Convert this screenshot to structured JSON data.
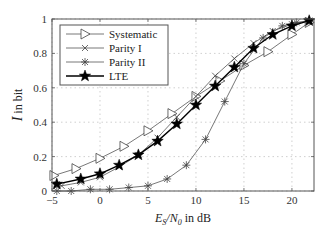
{
  "chart_data": {
    "type": "line",
    "title": "",
    "xlabel": "E_S/N_0 in dB",
    "ylabel": "I in bit",
    "xlim": [
      -5,
      22.3
    ],
    "ylim": [
      0,
      1
    ],
    "xticks": [
      -5,
      0,
      5,
      10,
      15,
      20
    ],
    "yticks": [
      0,
      0.2,
      0.4,
      0.6,
      0.8,
      1
    ],
    "xtick_labels": [
      "−5",
      "0",
      "5",
      "10",
      "15",
      "20"
    ],
    "ytick_labels": [
      "0",
      "0.2",
      "0.4",
      "0.6",
      "0.8",
      "1"
    ],
    "grid": true,
    "legend_position": "upper left",
    "series": [
      {
        "name": "Systematic",
        "marker": "triangle-right",
        "x": [
          -4.8,
          -2.5,
          0,
          2.5,
          5,
          7.5,
          10,
          12.5,
          15,
          17.5,
          20,
          21.8
        ],
        "y": [
          0.09,
          0.13,
          0.19,
          0.26,
          0.35,
          0.45,
          0.55,
          0.64,
          0.73,
          0.81,
          0.91,
          0.98
        ]
      },
      {
        "name": "Parity I",
        "marker": "x",
        "x": [
          -4.5,
          -4,
          -2,
          0,
          2,
          4,
          6,
          8,
          10,
          12,
          14,
          16,
          18,
          20,
          21.8
        ],
        "y": [
          0.04,
          0.03,
          0.05,
          0.08,
          0.14,
          0.21,
          0.31,
          0.43,
          0.55,
          0.67,
          0.77,
          0.86,
          0.93,
          0.97,
          0.99
        ]
      },
      {
        "name": "Parity II",
        "marker": "asterisk",
        "x": [
          -4.5,
          -3,
          -1,
          1,
          3,
          5,
          7,
          9,
          11,
          13,
          15,
          17,
          19,
          20.5,
          21.8
        ],
        "y": [
          0.0,
          0.0,
          0.01,
          0.01,
          0.02,
          0.03,
          0.07,
          0.15,
          0.3,
          0.52,
          0.74,
          0.89,
          0.96,
          0.98,
          0.99
        ]
      },
      {
        "name": "LTE",
        "marker": "star",
        "x": [
          -4.5,
          -2,
          0,
          2,
          4,
          6,
          8,
          10,
          12,
          14,
          16,
          18,
          20,
          21.8
        ],
        "y": [
          0.04,
          0.07,
          0.1,
          0.15,
          0.21,
          0.29,
          0.39,
          0.5,
          0.61,
          0.72,
          0.83,
          0.91,
          0.96,
          0.99
        ]
      }
    ]
  },
  "legend": {
    "items": [
      "Systematic",
      "Parity I",
      "Parity II",
      "LTE"
    ]
  },
  "axes": {
    "xlabel_main": "E",
    "xlabel_sub1": "S",
    "xlabel_slash": "/N",
    "xlabel_sub2": "0",
    "xlabel_tail": " in dB",
    "ylabel_main": "I",
    "ylabel_tail": " in bit"
  }
}
